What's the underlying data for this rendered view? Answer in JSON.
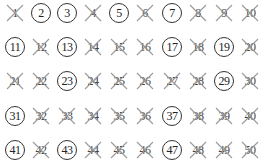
{
  "legend": {
    "circled": "prime",
    "crossed": "not prime"
  },
  "colors": {
    "background": "#ffffff",
    "text": "#222222",
    "circle": "#333333",
    "cross": "#999999"
  },
  "layout": {
    "columns": 10,
    "rows": 5,
    "col_x": [
      15,
      41,
      67,
      93,
      119,
      145,
      172,
      198,
      224,
      250
    ],
    "row_y": [
      13,
      47,
      81,
      116,
      150
    ]
  },
  "cells": [
    {
      "n": "1",
      "mark": "crossed"
    },
    {
      "n": "2",
      "mark": "circled"
    },
    {
      "n": "3",
      "mark": "circled"
    },
    {
      "n": "4",
      "mark": "crossed"
    },
    {
      "n": "5",
      "mark": "circled"
    },
    {
      "n": "6",
      "mark": "crossed"
    },
    {
      "n": "7",
      "mark": "circled"
    },
    {
      "n": "8",
      "mark": "crossed"
    },
    {
      "n": "9",
      "mark": "crossed"
    },
    {
      "n": "10",
      "mark": "crossed"
    },
    {
      "n": "11",
      "mark": "circled"
    },
    {
      "n": "12",
      "mark": "crossed"
    },
    {
      "n": "13",
      "mark": "circled"
    },
    {
      "n": "14",
      "mark": "crossed"
    },
    {
      "n": "15",
      "mark": "crossed"
    },
    {
      "n": "16",
      "mark": "crossed"
    },
    {
      "n": "17",
      "mark": "circled"
    },
    {
      "n": "18",
      "mark": "crossed"
    },
    {
      "n": "19",
      "mark": "circled"
    },
    {
      "n": "20",
      "mark": "crossed"
    },
    {
      "n": "21",
      "mark": "crossed"
    },
    {
      "n": "22",
      "mark": "crossed"
    },
    {
      "n": "23",
      "mark": "circled"
    },
    {
      "n": "24",
      "mark": "crossed"
    },
    {
      "n": "25",
      "mark": "crossed"
    },
    {
      "n": "26",
      "mark": "crossed"
    },
    {
      "n": "27",
      "mark": "crossed"
    },
    {
      "n": "28",
      "mark": "crossed"
    },
    {
      "n": "29",
      "mark": "circled"
    },
    {
      "n": "30",
      "mark": "crossed"
    },
    {
      "n": "31",
      "mark": "circled"
    },
    {
      "n": "32",
      "mark": "crossed"
    },
    {
      "n": "33",
      "mark": "crossed"
    },
    {
      "n": "34",
      "mark": "crossed"
    },
    {
      "n": "35",
      "mark": "crossed"
    },
    {
      "n": "36",
      "mark": "crossed"
    },
    {
      "n": "37",
      "mark": "circled"
    },
    {
      "n": "38",
      "mark": "crossed"
    },
    {
      "n": "39",
      "mark": "crossed"
    },
    {
      "n": "40",
      "mark": "crossed"
    },
    {
      "n": "41",
      "mark": "circled"
    },
    {
      "n": "42",
      "mark": "crossed"
    },
    {
      "n": "43",
      "mark": "circled"
    },
    {
      "n": "44",
      "mark": "crossed"
    },
    {
      "n": "45",
      "mark": "crossed"
    },
    {
      "n": "46",
      "mark": "crossed"
    },
    {
      "n": "47",
      "mark": "circled"
    },
    {
      "n": "48",
      "mark": "crossed"
    },
    {
      "n": "49",
      "mark": "crossed"
    },
    {
      "n": "50",
      "mark": "crossed"
    }
  ]
}
